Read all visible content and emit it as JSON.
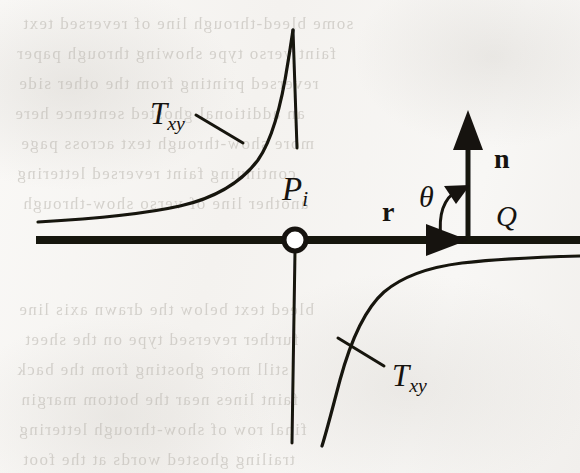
{
  "figure": {
    "ink_color": "#16130f",
    "paper_color": "#f7f6f4",
    "width": 580,
    "height": 473
  },
  "labels": {
    "t_upper": {
      "base": "T",
      "sub": "xy",
      "x": 150,
      "y": 96
    },
    "t_lower": {
      "base": "T",
      "sub": "xy",
      "x": 392,
      "y": 358
    },
    "p_point": {
      "base": "P",
      "sub": "i",
      "x": 282,
      "y": 171
    },
    "normal_vector": {
      "text": "n",
      "x": 494,
      "y": 143
    },
    "radius_vector": {
      "text": "r",
      "x": 382,
      "y": 196
    },
    "angle": {
      "text": "θ",
      "x": 419,
      "y": 180
    },
    "source_point": {
      "text": "Q",
      "x": 496,
      "y": 200
    }
  },
  "geometry": {
    "origin_marker": {
      "cx": 295,
      "cy": 240,
      "r": 11,
      "stroke_width": 5,
      "fill": "#ffffff"
    },
    "horizontal_axis": {
      "x1": 36,
      "y1": 240,
      "x2": 580,
      "y2": 240,
      "stroke_width": 8
    },
    "vertical_asymptote_upper": {
      "x1": 293,
      "y1": 30,
      "x2": 297,
      "y2": 148,
      "stroke_width": 3
    },
    "vertical_asymptote_lower": {
      "x1": 295,
      "y1": 251,
      "x2": 292,
      "y2": 443,
      "stroke_width": 3
    },
    "normal_arrow": {
      "x1": 468,
      "y1": 240,
      "x2": 468,
      "y2": 122,
      "stroke_width": 5
    },
    "axis_arrowhead_x": 468,
    "curve_stroke_width": 3.2
  },
  "ghost_text": [
    {
      "text": "some bleed-through line of reversed text",
      "x": 22,
      "y": 14,
      "size": 17
    },
    {
      "text": "faint verso type showing through paper",
      "x": 16,
      "y": 44,
      "size": 17
    },
    {
      "text": "reversed printing from the other side",
      "x": 18,
      "y": 74,
      "size": 17
    },
    {
      "text": "an additional ghosted sentence here",
      "x": 14,
      "y": 104,
      "size": 17
    },
    {
      "text": "more show-through text across page",
      "x": 20,
      "y": 134,
      "size": 17
    },
    {
      "text": "continuing faint reversed lettering",
      "x": 16,
      "y": 164,
      "size": 17
    },
    {
      "text": "another line of verso show-through",
      "x": 22,
      "y": 194,
      "size": 17
    },
    {
      "text": "bleed text below the drawn axis line",
      "x": 18,
      "y": 300,
      "size": 17
    },
    {
      "text": "further reversed type on the sheet",
      "x": 24,
      "y": 330,
      "size": 17
    },
    {
      "text": "still more ghosting from the back",
      "x": 16,
      "y": 360,
      "size": 17
    },
    {
      "text": "faint lines near the bottom margin",
      "x": 20,
      "y": 390,
      "size": 17
    },
    {
      "text": "final row of show-through lettering",
      "x": 18,
      "y": 420,
      "size": 17
    },
    {
      "text": "trailing ghosted words at the foot",
      "x": 22,
      "y": 450,
      "size": 17
    }
  ]
}
